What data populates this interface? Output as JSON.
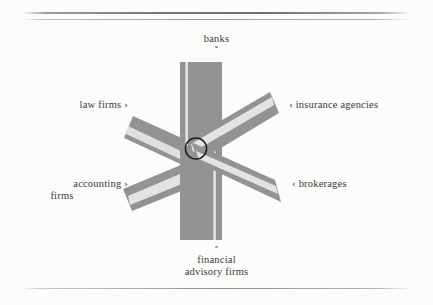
{
  "figure": {
    "type": "radial-spoke-diagram",
    "background_color": "#fcfcfb",
    "road_fill_color": "#939393",
    "road_stripe_color": "#e9e9e7",
    "hub_outline_color": "#1d1d1d",
    "rules": {
      "top_thick": "horizontal-rule-thick",
      "top_thin": "horizontal-rule-thin",
      "bottom": "horizontal-rule-thin"
    }
  },
  "hub": {
    "name": "center-hub-circle",
    "label": ""
  },
  "spokes": [
    {
      "id": "banks",
      "label": "banks",
      "pointer": "˅",
      "pointer_direction": "down",
      "position": "top",
      "angle_deg": 90
    },
    {
      "id": "insurance-agencies",
      "label": "insurance agencies",
      "pointer": "‹",
      "pointer_direction": "left",
      "position": "upper-right",
      "angle_deg": 30
    },
    {
      "id": "brokerages",
      "label": "brokerages",
      "pointer": "‹",
      "pointer_direction": "left",
      "position": "lower-right",
      "angle_deg": -30
    },
    {
      "id": "financial-advisory-firms",
      "label_line1": "financial",
      "label_line2": "advisory firms",
      "pointer": "˄",
      "pointer_direction": "up",
      "position": "bottom",
      "angle_deg": -90
    },
    {
      "id": "accounting-firms",
      "label_line1": "accounting",
      "label_line2": "firms",
      "pointer": "›",
      "pointer_direction": "right",
      "position": "lower-left",
      "angle_deg": -150
    },
    {
      "id": "law-firms",
      "label": "law firms",
      "pointer": "›",
      "pointer_direction": "right",
      "position": "upper-left",
      "angle_deg": 150
    }
  ]
}
